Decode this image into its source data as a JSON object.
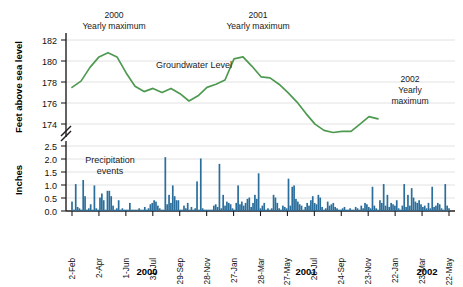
{
  "figure": {
    "background": "#ffffff",
    "line_color": "#4e9a51",
    "bar_color": "#2b6e9c",
    "grid_color": "#e2e2e2"
  },
  "top_panel": {
    "ylabel": "Feet above sea level",
    "yticks": [
      "182",
      "180",
      "178",
      "176",
      "174"
    ],
    "series_label": "Groundwater Level",
    "annotations": [
      {
        "id": "max2000",
        "line1": "2000",
        "line2": "Yearly maximum"
      },
      {
        "id": "max2001",
        "line1": "2001",
        "line2": "Yearly maximum"
      },
      {
        "id": "max2002",
        "line1": "2002",
        "line2": "Yearly",
        "line3": "maximum"
      }
    ]
  },
  "bottom_panel": {
    "ylabel": "Inches",
    "yticks": [
      "2.5",
      "2.0",
      "1.5",
      "1.0",
      "0.5",
      "0.0"
    ],
    "series_label_line1": "Precipitation",
    "series_label_line2": "events"
  },
  "xaxis": {
    "ticks": [
      "2-Feb",
      "2-Apr",
      "1-Jun",
      "31-Jul",
      "29-Sep",
      "28-Nov",
      "27-Jan",
      "28-Mar",
      "27-May",
      "26-Jul",
      "24-Sep",
      "23-Nov",
      "22-Jan",
      "23-Mar",
      "22-May"
    ],
    "year_groups": [
      "2000",
      "2001",
      "2002"
    ]
  },
  "chart_data": {
    "type": "line",
    "title": "",
    "xlabel": "",
    "ylabel": "Feet above sea level",
    "ylim": [
      173,
      183
    ],
    "grid": true,
    "legend": "none",
    "series": [
      {
        "name": "Groundwater Level",
        "units": "feet above sea level",
        "x_labels": [
          "2-Feb",
          "2-Apr",
          "1-Jun",
          "31-Jul",
          "29-Sep",
          "28-Nov",
          "27-Jan",
          "28-Mar",
          "27-May",
          "26-Jul",
          "24-Sep",
          "23-Nov",
          "22-Jan",
          "23-Mar",
          "22-May"
        ],
        "values": [
          178.7,
          179.3,
          180.6,
          181.6,
          182.0,
          181.6,
          180.1,
          178.8,
          178.3,
          178.6,
          178.2,
          178.6,
          178.1,
          177.4,
          177.9,
          178.6,
          178.9,
          179.3,
          181.3,
          181.6,
          180.7,
          179.7,
          179.6,
          179.0,
          178.2,
          177.3,
          176.2,
          175.2,
          174.6,
          174.4,
          174.5,
          174.5,
          175.2,
          175.9,
          175.7
        ]
      }
    ],
    "secondary": {
      "type": "bar",
      "name": "Precipitation events",
      "ylabel": "Inches",
      "ylim": [
        0.0,
        2.6
      ],
      "yticks": [
        0.0,
        0.5,
        1.0,
        1.5,
        2.0,
        2.5
      ],
      "values": [
        0.35,
        0.05,
        1.0,
        0.15,
        0.1,
        0.05,
        1.15,
        0.55,
        0.05,
        0.1,
        0.25,
        0.05,
        0.95,
        0.1,
        0.05,
        0.5,
        0.65,
        0.4,
        0.05,
        0.75,
        0.75,
        0.55,
        0.2,
        0.05,
        0.1,
        0.4,
        0.05,
        0.1,
        0.05,
        0.05,
        0.05,
        0.3,
        0.05,
        0.05,
        0.05,
        0.05,
        0.1,
        0.05,
        0.05,
        0.15,
        0.05,
        0.1,
        0.25,
        0.3,
        0.4,
        0.35,
        0.2,
        0.1,
        0.05,
        0.05,
        2.0,
        0.25,
        0.6,
        0.3,
        0.95,
        0.55,
        0.4,
        0.4,
        0.05,
        0.05,
        0.2,
        0.1,
        0.3,
        0.05,
        0.15,
        0.05,
        0.1,
        1.1,
        0.05,
        1.95,
        0.1,
        0.05,
        0.05,
        0.05,
        0.05,
        0.05,
        0.2,
        0.25,
        0.15,
        1.75,
        0.1,
        0.6,
        0.2,
        0.35,
        0.3,
        0.25,
        0.1,
        0.05,
        0.3,
        0.95,
        0.25,
        0.35,
        0.2,
        0.3,
        0.45,
        0.5,
        0.15,
        0.3,
        0.6,
        0.45,
        1.4,
        0.1,
        0.2,
        0.3,
        0.05,
        0.1,
        0.05,
        0.1,
        0.6,
        0.5,
        0.3,
        0.1,
        0.05,
        0.2,
        0.15,
        0.1,
        1.2,
        0.2,
        0.9,
        0.95,
        0.45,
        0.35,
        0.25,
        0.2,
        0.05,
        0.15,
        0.3,
        0.2,
        0.4,
        0.55,
        0.3,
        0.25,
        0.6,
        0.5,
        0.15,
        0.05,
        0.1,
        0.35,
        0.2,
        0.25,
        0.3,
        0.15,
        0.1,
        0.05,
        0.05,
        0.1,
        0.15,
        0.05,
        0.05,
        0.1,
        0.05,
        0.05,
        0.15,
        0.1,
        0.05,
        0.2,
        0.1,
        0.3,
        0.25,
        0.15,
        0.1,
        0.9,
        0.2,
        0.1,
        0.05,
        0.4,
        0.3,
        1.0,
        0.2,
        0.6,
        0.15,
        0.3,
        0.25,
        0.2,
        0.4,
        0.1,
        0.05,
        0.2,
        1.0,
        0.15,
        0.6,
        0.2,
        0.85,
        0.5,
        0.35,
        0.3,
        0.4,
        0.25,
        0.15,
        0.2,
        0.1,
        0.3,
        0.1,
        0.9,
        0.15,
        0.2,
        0.3,
        0.25,
        0.1,
        0.05,
        1.0,
        0.2,
        0.1
      ]
    }
  }
}
